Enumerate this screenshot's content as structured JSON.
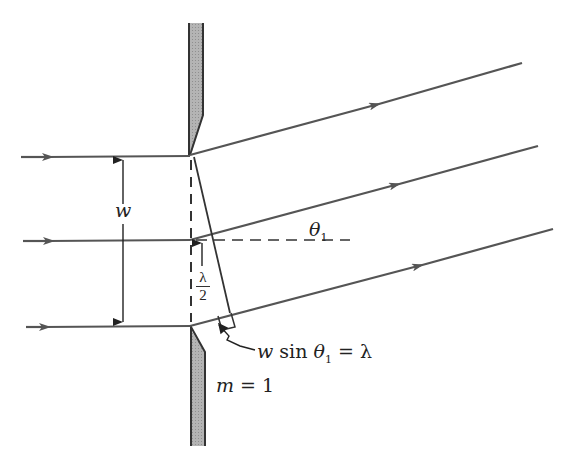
{
  "diagram": {
    "labels": {
      "slit_width": "w",
      "angle": "θ",
      "angle_subscript": "1",
      "half_wave_num": "λ",
      "half_wave_den": "2",
      "path_difference_w": "w",
      "path_difference_sin": "sin",
      "path_difference_theta": "θ",
      "path_difference_sub": "1",
      "path_difference_rhs": "= λ",
      "order_m": "m",
      "order_rhs": "= 1"
    },
    "colors": {
      "ray": "#555555",
      "barrier_fill": "#a9a9a9",
      "barrier_edge": "#333333",
      "construction": "#333333",
      "text": "#222222"
    },
    "rays": [
      {
        "name": "top",
        "in_y": 157,
        "out_end": [
          522,
          63
        ]
      },
      {
        "name": "middle",
        "in_y": 241,
        "out_end": [
          538,
          146
        ]
      },
      {
        "name": "bottom",
        "in_y": 326,
        "out_end": [
          553,
          229
        ]
      }
    ]
  }
}
